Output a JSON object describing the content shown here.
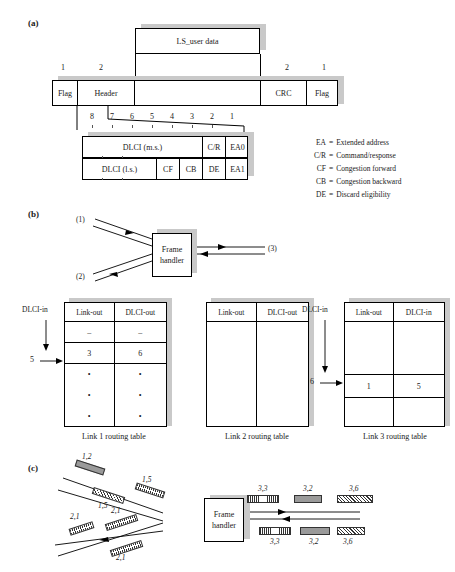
{
  "figure": {
    "panels": {
      "a": "(a)",
      "b": "(b)",
      "c": "(c)"
    }
  },
  "panel_a": {
    "user_data_box": "LS_user data",
    "byte_counts": {
      "flag_left": "1",
      "header": "2",
      "crc": "2",
      "flag_right": "1"
    },
    "frame_fields": {
      "flag_left": "Flag",
      "header": "Header",
      "info": "",
      "crc": "CRC",
      "flag_right": "Flag"
    },
    "bit_numbers": [
      "8",
      "7",
      "6",
      "5",
      "4",
      "3",
      "2",
      "1"
    ],
    "octet1": {
      "dlci": "DLCI (m.s.)",
      "cr": "C/R",
      "ea": "EA0"
    },
    "octet2": {
      "dlci": "DLCI (l.s.)",
      "cf": "CF",
      "cb": "CB",
      "de": "DE",
      "ea": "EA1"
    },
    "legend": [
      {
        "key": "EA",
        "eq": "=",
        "text": "Extended address"
      },
      {
        "key": "C/R",
        "eq": "=",
        "text": "Command/response"
      },
      {
        "key": "CF",
        "eq": "=",
        "text": "Congestion forward"
      },
      {
        "key": "CB",
        "eq": "=",
        "text": "Congestion backward"
      },
      {
        "key": "DE",
        "eq": "=",
        "text": "Discard eligibility"
      }
    ]
  },
  "panel_b": {
    "frame_handler": {
      "line1": "Frame",
      "line2": "handler"
    },
    "link_labels": {
      "link1": "(1)",
      "link2": "(2)",
      "link3": "(3)"
    },
    "tables": [
      {
        "caption": "Link 1 routing table",
        "in_label": "DLCI-in",
        "in_value": "5",
        "headers": [
          "Link-out",
          "DLCI-out"
        ],
        "rows": [
          {
            "type": "dash",
            "cells": [
              "–",
              "–"
            ]
          },
          {
            "type": "value",
            "cells": [
              "3",
              "6"
            ]
          },
          {
            "type": "dots",
            "cells": [
              "•",
              "•"
            ]
          },
          {
            "type": "dots",
            "cells": [
              "•",
              "•"
            ]
          },
          {
            "type": "dots",
            "cells": [
              "•",
              "•"
            ]
          }
        ]
      },
      {
        "caption": "Link 2 routing table",
        "in_label": "",
        "in_value": "",
        "headers": [
          "Link-out",
          "DLCI-out"
        ],
        "rows": [
          {
            "type": "empty",
            "cells": [
              "",
              ""
            ]
          },
          {
            "type": "empty",
            "cells": [
              "",
              ""
            ]
          },
          {
            "type": "empty",
            "cells": [
              "",
              ""
            ]
          },
          {
            "type": "empty",
            "cells": [
              "",
              ""
            ]
          },
          {
            "type": "empty",
            "cells": [
              "",
              ""
            ]
          }
        ]
      },
      {
        "caption": "Link 3 routing table",
        "in_label": "DLCI-in",
        "in_value": "6",
        "headers": [
          "Link-out",
          "DLCI-in"
        ],
        "rows": [
          {
            "type": "empty",
            "cells": [
              "",
              ""
            ]
          },
          {
            "type": "empty",
            "cells": [
              "",
              ""
            ]
          },
          {
            "type": "value",
            "cells": [
              "1",
              "5"
            ]
          },
          {
            "type": "empty",
            "cells": [
              "",
              ""
            ]
          },
          {
            "type": "empty",
            "cells": [
              "",
              ""
            ]
          }
        ]
      }
    ]
  },
  "panel_c": {
    "frame_handler": {
      "line1": "Frame",
      "line2": "handler"
    },
    "left_frames": [
      {
        "label": "1,2",
        "pattern": "pat-g"
      },
      {
        "label": "1,5",
        "pattern": "pat-v"
      },
      {
        "label": "1,5",
        "pattern": "pat-d"
      },
      {
        "label": "2,1",
        "pattern": "pat-v"
      },
      {
        "label": "2,1",
        "pattern": "pat-v"
      },
      {
        "label": "2,1",
        "pattern": "pat-v"
      }
    ],
    "right_frames_top": [
      {
        "label": "3,3",
        "pattern": "pat-v"
      },
      {
        "label": "3,2",
        "pattern": "pat-g"
      },
      {
        "label": "3,6",
        "pattern": "pat-d"
      }
    ],
    "right_frames_bottom": [
      {
        "label": "3,3",
        "pattern": "pat-v"
      },
      {
        "label": "3,2",
        "pattern": "pat-g"
      },
      {
        "label": "3,6",
        "pattern": "pat-d"
      }
    ]
  }
}
